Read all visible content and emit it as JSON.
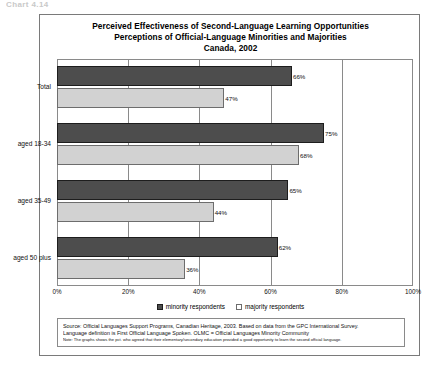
{
  "top_artifact": "Chart 4.14",
  "chart_data": {
    "type": "bar",
    "orientation": "horizontal",
    "title": "Perceived Effectiveness of Second-Language Learning Opportunities",
    "subtitle": "Perceptions of Official-Language Minorities and Majorities",
    "subtitle2": "Canada, 2002",
    "categories": [
      "Total",
      "aged 18-34",
      "aged 35-49",
      "aged 50 plus"
    ],
    "series": [
      {
        "name": "minority respondents",
        "color": "#4d4d4d",
        "values": [
          66,
          75,
          65,
          62
        ],
        "labels": [
          "66%",
          "75%",
          "65%",
          "62%"
        ]
      },
      {
        "name": "majority respondents",
        "color": "#d2d2d2",
        "values": [
          47,
          68,
          44,
          36
        ],
        "labels": [
          "47%",
          "68%",
          "44%",
          "36%"
        ]
      }
    ],
    "xlabel": "",
    "ylabel": "",
    "xlim": [
      0,
      100
    ],
    "xticks": [
      0,
      20,
      40,
      60,
      80,
      100
    ],
    "xtick_labels": [
      "0%",
      "20%",
      "40%",
      "60%",
      "80%",
      "100%"
    ],
    "grid": true,
    "legend_position": "bottom"
  },
  "source": {
    "line1": "Source:  Official Languages Support Programs, Canadian Heritage, 2003.  Based on data from the GPC International Survey.",
    "line2": "Language definition is First Official Language Spoken.  OLMC = Official Languages Minority Community",
    "note": "Note:  The graphs shows the pct. who agreed that their elementary/secondary education provided a good opportunity to learn the second official language."
  }
}
